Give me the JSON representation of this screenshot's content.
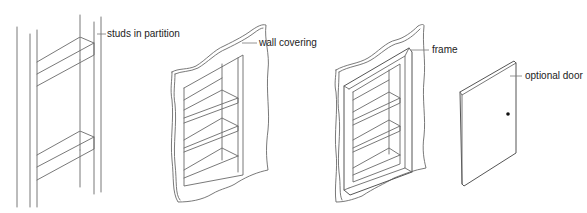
{
  "diagram": {
    "panels": [
      {
        "id": "studs",
        "label": "studs in partition"
      },
      {
        "id": "wall-covering",
        "label": "wall covering"
      },
      {
        "id": "frame",
        "label": "frame"
      },
      {
        "id": "door",
        "label": "optional door"
      }
    ],
    "colors": {
      "line": "#6a6a6a",
      "text": "#222222",
      "background": "#ffffff",
      "knob": "#111111"
    }
  }
}
